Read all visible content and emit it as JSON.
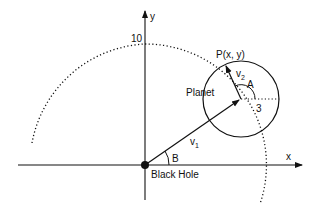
{
  "diagram": {
    "labels": {
      "y_axis": "y",
      "x_axis": "x",
      "y_tick": "10",
      "point": "P(x, y)",
      "planet": "Planet",
      "v2": "v",
      "v2_sub": "2",
      "v1": "v",
      "v1_sub": "1",
      "angle_a": "A",
      "angle_b": "B",
      "radius": "3",
      "black_hole": "Black Hole"
    },
    "colors": {
      "stroke": "#111111",
      "background": "#ffffff"
    }
  }
}
